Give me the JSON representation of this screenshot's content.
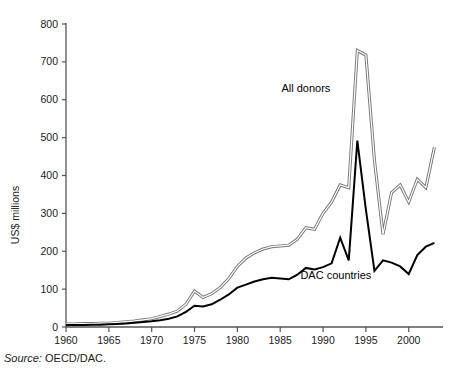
{
  "source_note": {
    "prefix": "Source:",
    "text": "OECD/DAC."
  },
  "chart_data": {
    "type": "line",
    "title": "",
    "subtitle": "",
    "xlabel": "",
    "ylabel": "US$ millions",
    "xlim": [
      1960,
      2004
    ],
    "ylim": [
      0,
      800
    ],
    "grid": false,
    "legend_position": "inline-annotations",
    "xticks": [
      1960,
      1965,
      1970,
      1975,
      1980,
      1985,
      1990,
      1995,
      2000
    ],
    "xtick_labels": [
      "1960",
      "1965",
      "1970",
      "1975",
      "1980",
      "1985",
      "1990",
      "1995",
      "2000"
    ],
    "yticks": [
      0,
      100,
      200,
      300,
      400,
      500,
      600,
      700,
      800
    ],
    "ytick_labels": [
      "0",
      "100",
      "200",
      "300",
      "400",
      "500",
      "600",
      "700",
      "800"
    ],
    "annotations": [
      {
        "text": "All donors",
        "x": 1988.0,
        "y": 620
      },
      {
        "text": "DAC countries",
        "x": 1991.5,
        "y": 128
      }
    ],
    "x": [
      1960,
      1961,
      1962,
      1963,
      1964,
      1965,
      1966,
      1967,
      1968,
      1969,
      1970,
      1971,
      1972,
      1973,
      1974,
      1975,
      1976,
      1977,
      1978,
      1979,
      1980,
      1981,
      1982,
      1983,
      1984,
      1985,
      1986,
      1987,
      1988,
      1989,
      1990,
      1991,
      1992,
      1993,
      1994,
      1995,
      1996,
      1997,
      1998,
      1999,
      2000,
      2001,
      2002,
      2003
    ],
    "series": [
      {
        "name": "All donors",
        "style": "outlined",
        "color": "#777777",
        "values": [
          8,
          8,
          9,
          9,
          10,
          10,
          12,
          14,
          16,
          19,
          22,
          28,
          34,
          42,
          60,
          95,
          78,
          88,
          104,
          128,
          160,
          182,
          196,
          206,
          212,
          214,
          216,
          232,
          262,
          258,
          300,
          330,
          375,
          368,
          730,
          718,
          440,
          245,
          355,
          375,
          330,
          390,
          368,
          475
        ]
      },
      {
        "name": "DAC countries",
        "style": "solid",
        "color": "#000000",
        "values": [
          5,
          5,
          5,
          6,
          6,
          7,
          8,
          9,
          11,
          13,
          15,
          18,
          22,
          28,
          40,
          56,
          54,
          60,
          72,
          86,
          104,
          112,
          120,
          126,
          130,
          128,
          126,
          138,
          156,
          152,
          158,
          168,
          236,
          176,
          492,
          310,
          148,
          176,
          170,
          160,
          140,
          190,
          212,
          222
        ]
      }
    ]
  }
}
